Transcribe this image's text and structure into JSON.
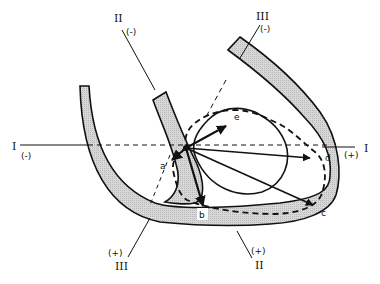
{
  "diagram": {
    "type": "cardiac vector loop diagram",
    "colors": {
      "line": "#111111",
      "wall_fill": "#cfcfcf",
      "background": "#ffffff"
    },
    "leads": [
      {
        "id": "I",
        "label": "I",
        "neg_sign": "(-)",
        "pos_sign": "(+)",
        "neg_label": "I",
        "pos_label": "I"
      },
      {
        "id": "II",
        "label": "II",
        "neg_sign": "(-)",
        "pos_sign": "(+)",
        "neg_label": "II",
        "pos_label": "II"
      },
      {
        "id": "III",
        "label": "III",
        "neg_sign": "(-)",
        "pos_sign": "(+)",
        "neg_label": "III",
        "pos_label": "III"
      }
    ],
    "vectors": [
      {
        "label": "a"
      },
      {
        "label": "b"
      },
      {
        "label": "c"
      },
      {
        "label": "d"
      },
      {
        "label": "e"
      }
    ]
  }
}
